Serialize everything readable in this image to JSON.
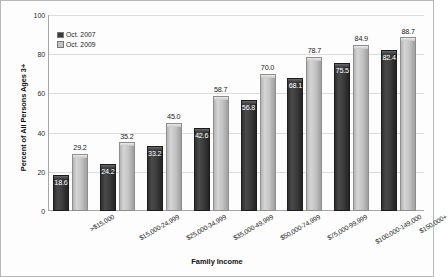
{
  "chart_data": {
    "type": "bar",
    "title": "",
    "xlabel": "Family Income",
    "ylabel": "Percent of All Persons Ages 3+",
    "ylim": [
      0,
      100
    ],
    "yticks": [
      0,
      20,
      40,
      60,
      80,
      100
    ],
    "grid": true,
    "legend_position": "top-left",
    "categories": [
      ">$15,000",
      "$15,000-24,999",
      "$25,000-34,999",
      "$35,000-49,999",
      "$50,000-74,999",
      "$75,000-99,999",
      "$100,000-149,000",
      "$150,000+"
    ],
    "series": [
      {
        "name": "Oct. 2007",
        "color": "#3a3a3a",
        "values": [
          18.6,
          24.2,
          33.2,
          42.6,
          56.8,
          68.1,
          75.5,
          82.4
        ]
      },
      {
        "name": "Oct. 2009",
        "color": "#c4c4c4",
        "values": [
          29.2,
          35.2,
          45.0,
          58.7,
          70.0,
          78.7,
          84.9,
          88.7
        ]
      }
    ],
    "data_labels": {
      "Oct. 2007": [
        "18.6",
        "24.2",
        "33.2",
        "42.6",
        "56.8",
        "68.1",
        "75.5",
        "82.4"
      ],
      "Oct. 2009": [
        "29.2",
        "35.2",
        "45.0",
        "58.7",
        "70.0",
        "78.7",
        "84.9",
        "88.7"
      ]
    }
  },
  "axes": {
    "y_tick_labels": [
      "0",
      "20",
      "40",
      "60",
      "80",
      "100"
    ],
    "y_title": "Percent of All Persons Ages 3+",
    "x_title": "Family Income"
  },
  "legend": {
    "items": [
      {
        "label": "Oct. 2007",
        "color": "#3a3a3a"
      },
      {
        "label": "Oct. 2009",
        "color": "#c4c4c4"
      }
    ]
  }
}
